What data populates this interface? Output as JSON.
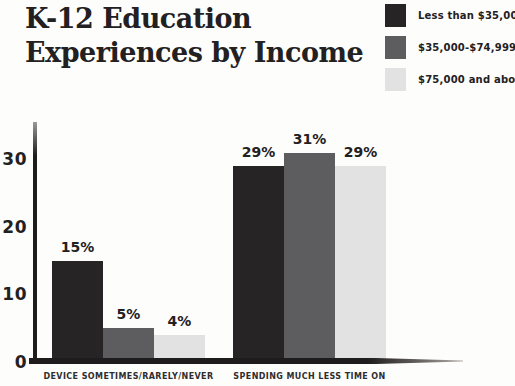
{
  "header": {
    "title_line1": "K-12 Education",
    "title_line2": "Experiences by Income"
  },
  "chart_data": {
    "type": "bar",
    "categories": [
      "DEVICE SOMETIMES/RARELY/NEVER",
      "SPENDING MUCH LESS TIME ON"
    ],
    "series": [
      {
        "name": "Less than $35,000",
        "color": "#272425",
        "values": [
          15,
          29
        ]
      },
      {
        "name": "$35,000-$74,999",
        "color": "#5d5d60",
        "values": [
          5,
          31
        ]
      },
      {
        "name": "$75,000 and above",
        "color": "#e2e2e3",
        "values": [
          4,
          29
        ]
      }
    ],
    "value_suffix": "%",
    "yticks": [
      0,
      10,
      20,
      30
    ],
    "ylim": [
      0,
      35
    ],
    "xlabel": "",
    "ylabel": "",
    "grid": false,
    "legend_position": "top-right"
  },
  "colors": {
    "text": "#232021",
    "axis": "#1f1c1d",
    "background": "#fdfdfc"
  }
}
